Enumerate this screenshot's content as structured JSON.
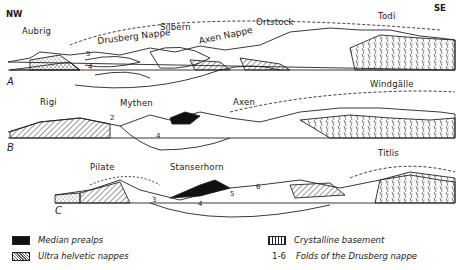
{
  "orientation": {
    "left": "NW",
    "right": "SE"
  },
  "sections": [
    {
      "id": "A",
      "peaks": [
        "Aubrig",
        "Silbern",
        "Ortstock",
        "Todi"
      ],
      "nappe_labels": [
        "Drusberg Nappe",
        "Axen Nappe"
      ],
      "fold_numbers": [
        "5",
        "4"
      ]
    },
    {
      "id": "B",
      "peaks": [
        "Rigi",
        "Mythen",
        "Axen",
        "Windgälle"
      ],
      "fold_numbers": [
        "2",
        "4"
      ]
    },
    {
      "id": "C",
      "peaks": [
        "Pilate",
        "Stanserhorn",
        "Titlis"
      ],
      "fold_numbers": [
        "3",
        "4",
        "5",
        "6"
      ]
    }
  ],
  "legend": [
    {
      "swatch": "black-fill",
      "label": "Median prealps"
    },
    {
      "swatch": "stippled",
      "label": "Ultra helvetic nappes"
    },
    {
      "swatch": "crystalline-hatch",
      "label": "Crystalline basement"
    },
    {
      "swatch": "text",
      "key": "1-6",
      "label": "Folds of the Drusberg nappe"
    }
  ]
}
